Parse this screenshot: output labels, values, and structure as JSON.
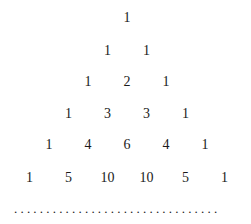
{
  "rows": [
    [
      1
    ],
    [
      1,
      1
    ],
    [
      1,
      2,
      1
    ],
    [
      1,
      3,
      3,
      1
    ],
    [
      1,
      4,
      6,
      4,
      1
    ],
    [
      1,
      5,
      10,
      10,
      5,
      1
    ]
  ],
  "continuation": "................................"
}
